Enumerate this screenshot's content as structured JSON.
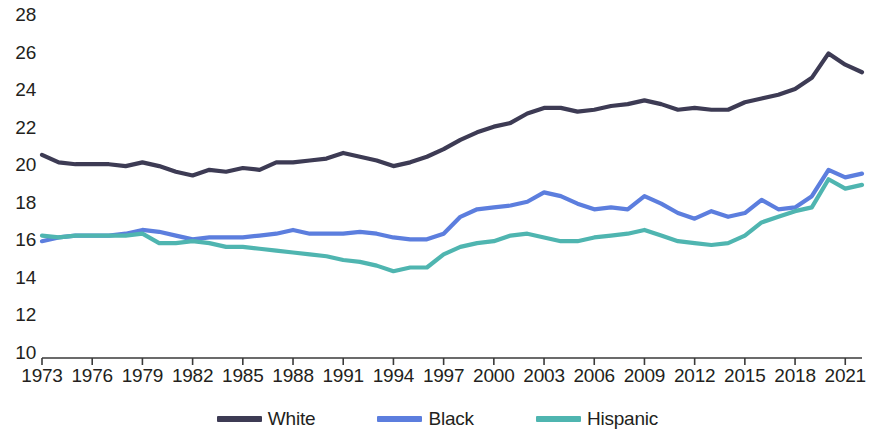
{
  "chart_data": {
    "type": "line",
    "title": "",
    "subtitle": "",
    "xlabel": "",
    "ylabel": "",
    "grid": false,
    "legend_position": "bottom",
    "xlim": [
      1973,
      2022
    ],
    "ylim": [
      10,
      28
    ],
    "y_ticks": [
      28,
      26,
      24,
      22,
      20,
      18,
      16,
      14,
      12,
      10
    ],
    "x_ticks": [
      1973,
      1976,
      1979,
      1982,
      1985,
      1988,
      1991,
      1994,
      1997,
      2000,
      2003,
      2006,
      2009,
      2012,
      2015,
      2018,
      2021
    ],
    "x": [
      1973,
      1974,
      1975,
      1976,
      1977,
      1978,
      1979,
      1980,
      1981,
      1982,
      1983,
      1984,
      1985,
      1986,
      1987,
      1988,
      1989,
      1990,
      1991,
      1992,
      1993,
      1994,
      1995,
      1996,
      1997,
      1998,
      1999,
      2000,
      2001,
      2002,
      2003,
      2004,
      2005,
      2006,
      2007,
      2008,
      2009,
      2010,
      2011,
      2012,
      2013,
      2014,
      2015,
      2016,
      2017,
      2018,
      2019,
      2020,
      2021,
      2022
    ],
    "series": [
      {
        "name": "White",
        "color": "#3d3b54",
        "values": [
          20.5,
          20.1,
          20.0,
          20.0,
          20.0,
          19.9,
          20.1,
          19.9,
          19.6,
          19.4,
          19.7,
          19.6,
          19.8,
          19.7,
          20.1,
          20.1,
          20.2,
          20.3,
          20.6,
          20.4,
          20.2,
          19.9,
          20.1,
          20.4,
          20.8,
          21.3,
          21.7,
          22.0,
          22.2,
          22.7,
          23.0,
          23.0,
          22.8,
          22.9,
          23.1,
          23.2,
          23.4,
          23.2,
          22.9,
          23.0,
          22.9,
          22.9,
          23.3,
          23.5,
          23.7,
          24.0,
          24.6,
          25.9,
          25.3,
          24.9
        ]
      },
      {
        "name": "Black",
        "color": "#5c7ede",
        "values": [
          15.9,
          16.1,
          16.2,
          16.2,
          16.2,
          16.3,
          16.5,
          16.4,
          16.2,
          16.0,
          16.1,
          16.1,
          16.1,
          16.2,
          16.3,
          16.5,
          16.3,
          16.3,
          16.3,
          16.4,
          16.3,
          16.1,
          16.0,
          16.0,
          16.3,
          17.2,
          17.6,
          17.7,
          17.8,
          18.0,
          18.5,
          18.3,
          17.9,
          17.6,
          17.7,
          17.6,
          18.3,
          17.9,
          17.4,
          17.1,
          17.5,
          17.2,
          17.4,
          18.1,
          17.6,
          17.7,
          18.3,
          19.7,
          19.3,
          19.5
        ]
      },
      {
        "name": "Hispanic",
        "color": "#4fb5b0",
        "values": [
          16.2,
          16.1,
          16.2,
          16.2,
          16.2,
          16.2,
          16.3,
          15.8,
          15.8,
          15.9,
          15.8,
          15.6,
          15.6,
          15.5,
          15.4,
          15.3,
          15.2,
          15.1,
          14.9,
          14.8,
          14.6,
          14.3,
          14.5,
          14.5,
          15.2,
          15.6,
          15.8,
          15.9,
          16.2,
          16.3,
          16.1,
          15.9,
          15.9,
          16.1,
          16.2,
          16.3,
          16.5,
          16.2,
          15.9,
          15.8,
          15.7,
          15.8,
          16.2,
          16.9,
          17.2,
          17.5,
          17.7,
          19.2,
          18.7,
          18.9
        ]
      }
    ],
    "legend": [
      {
        "label": "White",
        "color": "#3d3b54"
      },
      {
        "label": "Black",
        "color": "#5c7ede"
      },
      {
        "label": "Hispanic",
        "color": "#4fb5b0"
      }
    ],
    "axis_color": "#3a3a3a"
  }
}
